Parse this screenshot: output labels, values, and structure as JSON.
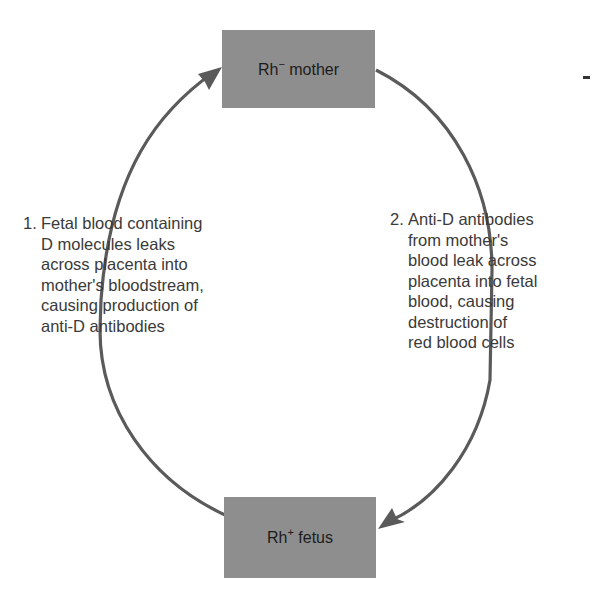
{
  "diagram": {
    "nodes": [
      {
        "id": "mother",
        "label_base": "Rh",
        "label_sup": "−",
        "label_rest": " mother",
        "fill": "#8e8e8e"
      },
      {
        "id": "fetus",
        "label_base": "Rh",
        "label_sup": "+",
        "label_rest": " fetus",
        "fill": "#8e8e8e"
      }
    ],
    "edges": [
      {
        "from": "fetus",
        "to": "mother",
        "side": "left",
        "color": "#5a5a5a"
      },
      {
        "from": "mother",
        "to": "fetus",
        "side": "right",
        "color": "#5a5a5a"
      }
    ],
    "steps": [
      {
        "number": "1.",
        "lines": [
          "Fetal blood containing",
          "D molecules leaks",
          "across placenta into",
          "mother's bloodstream,",
          "causing production of",
          "anti-D antibodies"
        ]
      },
      {
        "number": "2.",
        "lines": [
          "Anti-D antibodies",
          "from mother's",
          "blood leak across",
          "placenta into fetal",
          "blood, causing",
          "destruction of",
          "red blood cells"
        ]
      }
    ]
  }
}
